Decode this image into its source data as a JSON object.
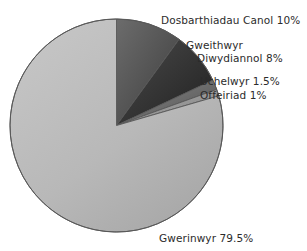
{
  "chart_data": {
    "type": "pie",
    "title": "",
    "subtitle": "",
    "xlabel": "",
    "ylabel": "",
    "legend_position": "none",
    "grid": false,
    "units": "percent",
    "start_angle_deg": 0,
    "direction": "clockwise",
    "categories": [
      "Dosbarthiadau Canol",
      "Gweithwyr Diwydiannol",
      "Uchelwyr",
      "Offeiriad",
      "Gwerinwyr"
    ],
    "values": [
      10,
      8,
      1.5,
      1,
      79.5
    ],
    "slices": [
      {
        "name": "Dosbarthiadau Canol",
        "value": 10,
        "value_text": "10%",
        "label_text": "Dosbarthiadau Canol 10%",
        "color": "#565656",
        "color_light": "#6c6c6c",
        "color_dark": "#3d3d3d"
      },
      {
        "name": "Gweithwyr Diwydiannol",
        "value": 8,
        "value_text": "8%",
        "label_line1": "Gweithwyr",
        "label_line2": "Diwydiannol 8%",
        "label_text": "Gweithwyr Diwydiannol 8%",
        "color": "#343434",
        "color_light": "#4a4a4a",
        "color_dark": "#202020"
      },
      {
        "name": "Uchelwyr",
        "value": 1.5,
        "value_text": "1.5%",
        "label_text": "Uchelwyr 1.5%",
        "color": "#6e6e6e",
        "color_light": "#8a8a8a",
        "color_dark": "#4f4f4f"
      },
      {
        "name": "Offeiriad",
        "value": 1,
        "value_text": "1%",
        "label_text": "Offeiriad 1%",
        "color": "#9a9a9a",
        "color_light": "#b2b2b2",
        "color_dark": "#7d7d7d"
      },
      {
        "name": "Gwerinwyr",
        "value": 79.5,
        "value_text": "79.5%",
        "label_text": "Gwerinwyr 79.5%",
        "color": "#b6b6b6",
        "color_light": "#c9c9c9",
        "color_dark": "#a3a3a3"
      }
    ],
    "total": 100,
    "outline_color": "#585858",
    "background": "#ffffff",
    "text_color": "#2b2b2b"
  },
  "labels": {
    "dosbarthiadau": "Dosbarthiadau Canol 10%",
    "gweithwyr_line1": "Gweithwyr",
    "gweithwyr_line2": "Diwydiannol 8%",
    "uchelwyr": "Uchelwyr 1.5%",
    "offeiriad": "Offeiriad 1%",
    "gwerinwyr": "Gwerinwyr 79.5%"
  }
}
